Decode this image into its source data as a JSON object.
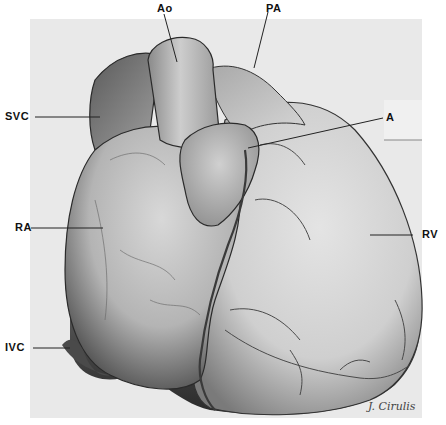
{
  "figure": {
    "colors": {
      "plate": "#e9e9e9",
      "outline": "#2a2a2a",
      "label": "#111111"
    }
  },
  "labels": {
    "ao": "Ao",
    "pa": "PA",
    "svc": "SVC",
    "a": "A",
    "ra": "RA",
    "rv": "RV",
    "ivc": "IVC"
  },
  "signature": "J. Cirulis"
}
